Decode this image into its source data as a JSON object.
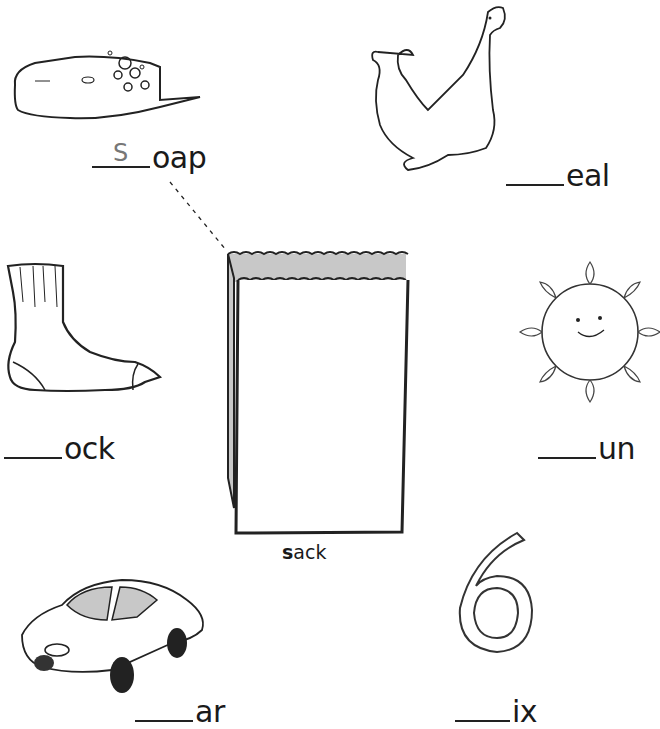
{
  "worksheet": {
    "center_item": {
      "picture": "paper-sack",
      "caption_highlight": "s",
      "caption_rest": "ack",
      "word": "sack"
    },
    "items": [
      {
        "picture": "soap",
        "blank": "",
        "example_letter": "S",
        "ending": "oap"
      },
      {
        "picture": "seal",
        "blank": "",
        "ending": "eal"
      },
      {
        "picture": "sock",
        "blank": "",
        "ending": "ock"
      },
      {
        "picture": "sun",
        "blank": "",
        "ending": "un"
      },
      {
        "picture": "car",
        "blank": "",
        "ending": "ar"
      },
      {
        "picture": "number-six",
        "blank": "",
        "ending": "ix"
      }
    ],
    "colors": {
      "ink": "#1a1a1a",
      "sack_interior": "#c8c8c8",
      "traced_letter": "#777777"
    }
  }
}
